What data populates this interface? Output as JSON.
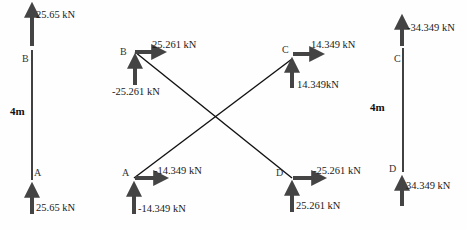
{
  "colors": {
    "member": "#111111",
    "arrow": "#444444",
    "text": "#1a1a1a"
  },
  "left_member": {
    "top_node": "B",
    "bottom_node": "A",
    "length": "4m",
    "top_force": "25.65 kN",
    "bottom_force": "25.65 kN"
  },
  "middle_frame": {
    "nodes": {
      "B": {
        "label": "B",
        "horizontal_force": "25.261 kN",
        "vertical_force": "-25.261 kN"
      },
      "A": {
        "label": "A",
        "horizontal_force": "-14.349 kN",
        "vertical_force": "-14.349 kN"
      },
      "C": {
        "label": "C",
        "horizontal_force": "14.349 kN",
        "vertical_force": "14.349kN"
      },
      "D": {
        "label": "D",
        "horizontal_force": "-25.261 kN",
        "vertical_force": "25.261 kN"
      }
    },
    "members": [
      "B-D",
      "A-C"
    ]
  },
  "right_member": {
    "top_node": "C",
    "bottom_node": "D",
    "length": "4m",
    "top_force": "-34.349 kN",
    "bottom_force": "34.349 kN"
  }
}
